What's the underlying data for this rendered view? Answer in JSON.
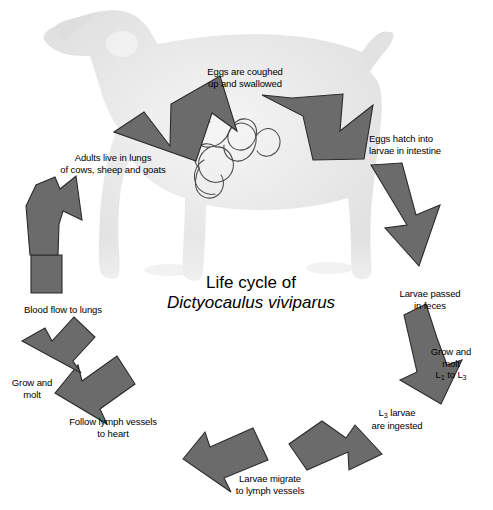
{
  "figure": {
    "title_line1": "Life cycle of",
    "title_line2": "Dictyocaulus viviparus",
    "caption": "",
    "arrow_color": "#6b6b6b",
    "arrow_stroke": "#2a2a2a",
    "animal_color": "#e6e6e6",
    "worm_stroke": "#444444",
    "background": "#ffffff",
    "animal_name": "goat-silhouette",
    "worm_name": "lungworm-drawing"
  },
  "steps": [
    {
      "id": "eggs-coughed",
      "label": "Eggs are coughed\nup and swallowed",
      "arrow": "arrow-eggs-coughed"
    },
    {
      "id": "eggs-hatch",
      "label": "Eggs hatch into\nlarvae in intestine",
      "arrow": "arrow-eggs-hatch"
    },
    {
      "id": "larvae-passed",
      "label": "Larvae passed\nin feces",
      "arrow": "arrow-larvae-passed"
    },
    {
      "id": "grow-molt-l1-l3",
      "label_line1": "Grow and",
      "label_line2": "molt",
      "label_line3_a": "L",
      "label_line3_sub_a": "1",
      "label_line3_mid": " to L",
      "label_line3_sub_b": "3",
      "arrow": "arrow-grow-molt-l1-l3"
    },
    {
      "id": "l3-ingested",
      "label_line1_a": "L",
      "label_line1_sub": "3",
      "label_line1_b": " larvae",
      "label_line2": "are ingested",
      "arrow": "arrow-l3-ingested"
    },
    {
      "id": "larvae-migrate",
      "label": "Larvae migrate\nto lymph vessels",
      "arrow": "arrow-larvae-migrate"
    },
    {
      "id": "follow-lymph",
      "label": "Follow lymph vessels\nto heart",
      "arrow": "arrow-follow-lymph"
    },
    {
      "id": "grow-molt",
      "label": "Grow and\nmolt",
      "arrow": "arrow-grow-molt"
    },
    {
      "id": "blood-flow",
      "label": "Blood flow to lungs",
      "arrow": "arrow-blood-flow"
    },
    {
      "id": "adults-live",
      "label": "Adults live in lungs\nof cows, sheep and goats",
      "arrow": "arrow-adults-live"
    }
  ]
}
